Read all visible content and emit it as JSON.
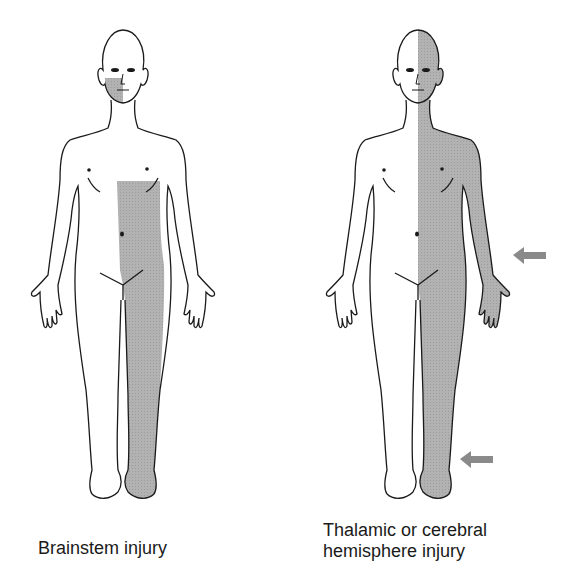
{
  "figures": [
    {
      "id": "brainstem",
      "caption": "Brainstem injury",
      "shaded_regions": [
        "face (figure's right side)",
        "trunk and leg below chest (figure's left side)"
      ],
      "arrows": 0
    },
    {
      "id": "thalamic",
      "caption_line1": "Thalamic or cerebral",
      "caption_line2": "hemisphere injury",
      "shaded_regions": [
        "entire figure's left side: head, face, trunk, arm, leg"
      ],
      "arrows": 2
    }
  ],
  "colors": {
    "shade": "#a9a9a9",
    "outline": "#1a1a1a",
    "arrow": "#8a8a8a"
  }
}
